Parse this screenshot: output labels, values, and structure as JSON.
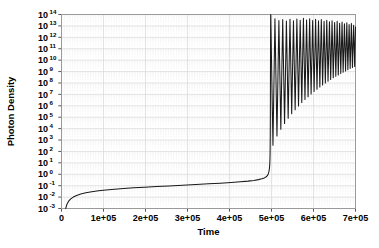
{
  "chart_data": {
    "type": "line",
    "title": "",
    "xlabel": "Time",
    "ylabel": "Photon Density",
    "xlim": [
      0,
      700000
    ],
    "ylim": [
      -3,
      14
    ],
    "y_scale": "log10",
    "grid": true,
    "legend": "none",
    "line_color": "#1a1a1a",
    "grid_color": "#d8d8d8",
    "minor_grid_color": "#e8e8e8",
    "frame_color": "#9a9a9a",
    "background": "#ffffff",
    "xticks": [
      {
        "value": 0,
        "label": "0"
      },
      {
        "value": 100000,
        "label": "1e+05"
      },
      {
        "value": 200000,
        "label": "2e+05"
      },
      {
        "value": 300000,
        "label": "3e+05"
      },
      {
        "value": 400000,
        "label": "4e+05"
      },
      {
        "value": 500000,
        "label": "5e+05"
      },
      {
        "value": 600000,
        "label": "6e+05"
      },
      {
        "value": 700000,
        "label": "7e+05"
      }
    ],
    "yticks": [
      {
        "exp": 14,
        "base": "10",
        "exponent": "14"
      },
      {
        "exp": 13,
        "base": "10",
        "exponent": "13"
      },
      {
        "exp": 12,
        "base": "10",
        "exponent": "12"
      },
      {
        "exp": 11,
        "base": "10",
        "exponent": "11"
      },
      {
        "exp": 10,
        "base": "10",
        "exponent": "10"
      },
      {
        "exp": 9,
        "base": "10",
        "exponent": "9"
      },
      {
        "exp": 8,
        "base": "10",
        "exponent": "8"
      },
      {
        "exp": 7,
        "base": "10",
        "exponent": "7"
      },
      {
        "exp": 6,
        "base": "10",
        "exponent": "6"
      },
      {
        "exp": 5,
        "base": "10",
        "exponent": "5"
      },
      {
        "exp": 4,
        "base": "10",
        "exponent": "4"
      },
      {
        "exp": 3,
        "base": "10",
        "exponent": "3"
      },
      {
        "exp": 2,
        "base": "10",
        "exponent": "2"
      },
      {
        "exp": 1,
        "base": "10",
        "exponent": "1"
      },
      {
        "exp": 0,
        "base": "10",
        "exponent": "0"
      },
      {
        "exp": -1,
        "base": "10",
        "exponent": "-1"
      },
      {
        "exp": -2,
        "base": "10",
        "exponent": "-2"
      },
      {
        "exp": -3,
        "base": "10",
        "exponent": "-3"
      }
    ],
    "series": [
      {
        "name": "photon density",
        "ramp": [
          {
            "x": 10000,
            "y": -3.0
          },
          {
            "x": 13000,
            "y": -2.62
          },
          {
            "x": 17000,
            "y": -2.36
          },
          {
            "x": 22000,
            "y": -2.16
          },
          {
            "x": 28000,
            "y": -2.0
          },
          {
            "x": 36000,
            "y": -1.86
          },
          {
            "x": 46000,
            "y": -1.73
          },
          {
            "x": 58000,
            "y": -1.62
          },
          {
            "x": 72000,
            "y": -1.53
          },
          {
            "x": 88000,
            "y": -1.45
          },
          {
            "x": 106000,
            "y": -1.38
          },
          {
            "x": 126000,
            "y": -1.31
          },
          {
            "x": 148000,
            "y": -1.25
          },
          {
            "x": 172000,
            "y": -1.19
          },
          {
            "x": 198000,
            "y": -1.13
          },
          {
            "x": 226000,
            "y": -1.08
          },
          {
            "x": 256000,
            "y": -1.02
          },
          {
            "x": 288000,
            "y": -0.96
          },
          {
            "x": 320000,
            "y": -0.9
          },
          {
            "x": 350000,
            "y": -0.84
          },
          {
            "x": 378000,
            "y": -0.78
          },
          {
            "x": 404000,
            "y": -0.72
          },
          {
            "x": 426000,
            "y": -0.66
          },
          {
            "x": 444000,
            "y": -0.6
          },
          {
            "x": 458000,
            "y": -0.54
          },
          {
            "x": 469000,
            "y": -0.47
          },
          {
            "x": 477000,
            "y": -0.4
          },
          {
            "x": 483000,
            "y": -0.32
          },
          {
            "x": 487500,
            "y": -0.22
          },
          {
            "x": 490500,
            "y": -0.1
          },
          {
            "x": 492500,
            "y": 0.05
          },
          {
            "x": 494000,
            "y": 0.25
          },
          {
            "x": 495000,
            "y": 0.5
          },
          {
            "x": 495800,
            "y": 0.85
          },
          {
            "x": 496300,
            "y": 1.3
          },
          {
            "x": 496700,
            "y": 2.0
          },
          {
            "x": 497000,
            "y": 3.2
          },
          {
            "x": 497250,
            "y": 5.0
          },
          {
            "x": 497450,
            "y": 7.4
          },
          {
            "x": 497650,
            "y": 10.2
          },
          {
            "x": 497850,
            "y": 12.6
          },
          {
            "x": 498050,
            "y": 13.9
          },
          {
            "x": 498200,
            "y": 14.0
          }
        ],
        "oscillations": [
          {
            "peak_x": 498200,
            "peak_y": 14.0,
            "trough_x": 503500,
            "trough_y": 2.55
          },
          {
            "peak_x": 508200,
            "peak_y": 13.62,
            "trough_x": 513000,
            "trough_y": 3.35
          },
          {
            "peak_x": 517600,
            "peak_y": 13.48,
            "trough_x": 522200,
            "trough_y": 3.95
          },
          {
            "peak_x": 526700,
            "peak_y": 13.55,
            "trough_x": 531100,
            "trough_y": 4.45
          },
          {
            "peak_x": 535500,
            "peak_y": 13.42,
            "trough_x": 539700,
            "trough_y": 4.9
          },
          {
            "peak_x": 544000,
            "peak_y": 13.58,
            "trough_x": 548100,
            "trough_y": 5.3
          },
          {
            "peak_x": 552300,
            "peak_y": 13.45,
            "trough_x": 556300,
            "trough_y": 5.65
          },
          {
            "peak_x": 560400,
            "peak_y": 13.6,
            "trough_x": 564300,
            "trough_y": 5.98
          },
          {
            "peak_x": 568300,
            "peak_y": 13.5,
            "trough_x": 572100,
            "trough_y": 6.28
          },
          {
            "peak_x": 576000,
            "peak_y": 13.66,
            "trough_x": 579700,
            "trough_y": 6.55
          },
          {
            "peak_x": 583500,
            "peak_y": 13.52,
            "trough_x": 587100,
            "trough_y": 6.8
          },
          {
            "peak_x": 590800,
            "peak_y": 13.62,
            "trough_x": 594300,
            "trough_y": 7.03
          },
          {
            "peak_x": 598000,
            "peak_y": 13.48,
            "trough_x": 601400,
            "trough_y": 7.25
          },
          {
            "peak_x": 605000,
            "peak_y": 13.58,
            "trough_x": 608300,
            "trough_y": 7.45
          },
          {
            "peak_x": 611900,
            "peak_y": 13.44,
            "trough_x": 615100,
            "trough_y": 7.64
          },
          {
            "peak_x": 618600,
            "peak_y": 13.56,
            "trough_x": 621700,
            "trough_y": 7.82
          },
          {
            "peak_x": 625200,
            "peak_y": 13.4,
            "trough_x": 628200,
            "trough_y": 7.99
          },
          {
            "peak_x": 631600,
            "peak_y": 13.5,
            "trough_x": 634600,
            "trough_y": 8.15
          },
          {
            "peak_x": 638000,
            "peak_y": 13.36,
            "trough_x": 640900,
            "trough_y": 8.3
          },
          {
            "peak_x": 644200,
            "peak_y": 13.46,
            "trough_x": 647000,
            "trough_y": 8.45
          },
          {
            "peak_x": 650300,
            "peak_y": 13.3,
            "trough_x": 653100,
            "trough_y": 8.58
          },
          {
            "peak_x": 656300,
            "peak_y": 13.4,
            "trough_x": 659000,
            "trough_y": 8.71
          },
          {
            "peak_x": 662200,
            "peak_y": 13.24,
            "trough_x": 664900,
            "trough_y": 8.83
          },
          {
            "peak_x": 668000,
            "peak_y": 13.34,
            "trough_x": 670600,
            "trough_y": 8.95
          },
          {
            "peak_x": 673700,
            "peak_y": 13.18,
            "trough_x": 676300,
            "trough_y": 9.06
          },
          {
            "peak_x": 679300,
            "peak_y": 13.28,
            "trough_x": 681800,
            "trough_y": 9.16
          },
          {
            "peak_x": 684800,
            "peak_y": 13.12,
            "trough_x": 687300,
            "trough_y": 9.26
          },
          {
            "peak_x": 690200,
            "peak_y": 13.22,
            "trough_x": 692700,
            "trough_y": 9.35
          },
          {
            "peak_x": 695500,
            "peak_y": 13.05,
            "trough_x": 698000,
            "trough_y": 9.44
          },
          {
            "peak_x": 700000,
            "peak_y": 12.9,
            "trough_x": 700000,
            "trough_y": 12.9
          }
        ]
      }
    ]
  }
}
